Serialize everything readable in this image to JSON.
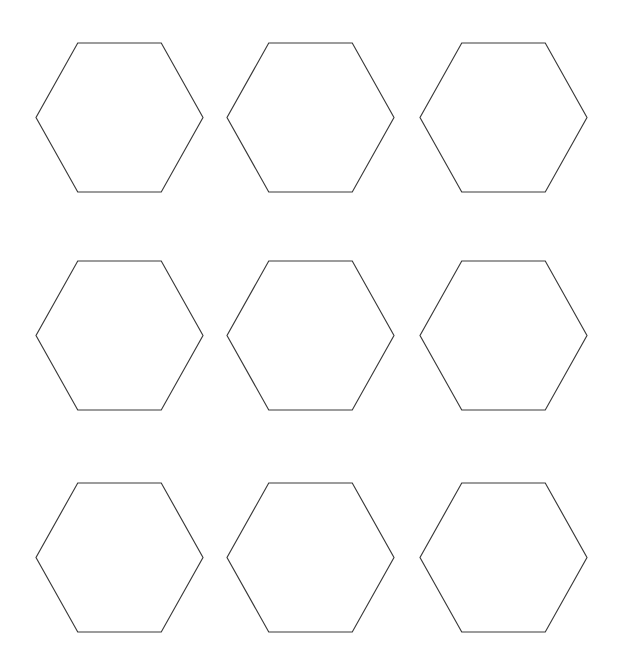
{
  "page": {
    "background_color": "#ffffff",
    "width": 619,
    "height": 668
  },
  "shape_style": {
    "stroke_color": "#3a3a3a",
    "fill_color": "none",
    "stroke_width": 1.15,
    "shape_name": "hexagon",
    "orientation": "flat-top",
    "sides": 6
  },
  "grid": {
    "rows": 3,
    "columns": 3,
    "total_shapes": 9,
    "column_pitch": 192,
    "row_pitch": 220,
    "hex_width": 167,
    "hex_height": 149,
    "column_left_positions": [
      36,
      227,
      420
    ],
    "row_top_positions": [
      43,
      261,
      483
    ]
  },
  "shapes": [
    {
      "name": "hexagon-r1-c1",
      "row": 1,
      "column": 1,
      "x": 36,
      "y": 43,
      "width": 167,
      "height": 149
    },
    {
      "name": "hexagon-r1-c2",
      "row": 1,
      "column": 2,
      "x": 227,
      "y": 43,
      "width": 167,
      "height": 149
    },
    {
      "name": "hexagon-r1-c3",
      "row": 1,
      "column": 3,
      "x": 420,
      "y": 43,
      "width": 167,
      "height": 149
    },
    {
      "name": "hexagon-r2-c1",
      "row": 2,
      "column": 1,
      "x": 36,
      "y": 261,
      "width": 167,
      "height": 149
    },
    {
      "name": "hexagon-r2-c2",
      "row": 2,
      "column": 2,
      "x": 227,
      "y": 261,
      "width": 167,
      "height": 149
    },
    {
      "name": "hexagon-r2-c3",
      "row": 2,
      "column": 3,
      "x": 420,
      "y": 261,
      "width": 167,
      "height": 149
    },
    {
      "name": "hexagon-r3-c1",
      "row": 3,
      "column": 1,
      "x": 36,
      "y": 483,
      "width": 167,
      "height": 149
    },
    {
      "name": "hexagon-r3-c2",
      "row": 3,
      "column": 2,
      "x": 227,
      "y": 483,
      "width": 167,
      "height": 149
    },
    {
      "name": "hexagon-r3-c3",
      "row": 3,
      "column": 3,
      "x": 420,
      "y": 483,
      "width": 167,
      "height": 149
    }
  ]
}
